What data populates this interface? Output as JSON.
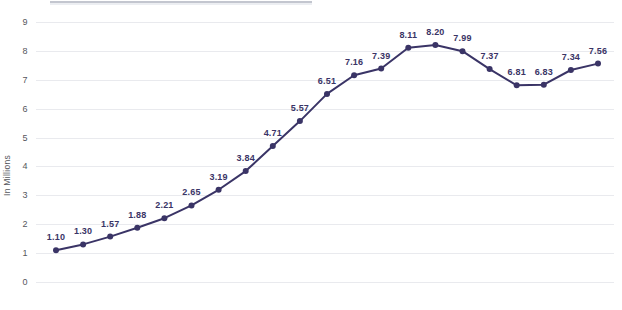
{
  "chart_data": {
    "type": "line",
    "title": "",
    "subtitle": "",
    "xlabel": "",
    "ylabel": "In Millions",
    "categories": [
      "1801",
      "1811",
      "1821",
      "1831",
      "1841",
      "1851",
      "1861",
      "1871",
      "1881",
      "1891",
      "1901",
      "1911",
      "1921",
      "1931",
      "1951",
      "1961",
      "1971",
      "1981",
      "1991",
      "2001",
      "2006"
    ],
    "x_tick_labels": [
      "1801",
      "1811",
      "1821",
      "1831",
      "1841",
      "1851",
      "1861",
      "1871",
      "1881",
      "1891",
      "1901",
      "1911",
      "1921",
      "1931",
      "1951",
      "1961",
      "1971",
      "1981",
      "1991",
      "2001",
      "2006"
    ],
    "values": [
      1.1,
      1.3,
      1.57,
      1.88,
      2.21,
      2.65,
      3.19,
      3.84,
      4.71,
      5.57,
      6.51,
      7.16,
      7.39,
      8.11,
      8.2,
      7.99,
      7.37,
      6.81,
      6.83,
      7.34,
      7.56
    ],
    "point_labels": [
      "1.10",
      "1.30",
      "1.57",
      "1.88",
      "2.21",
      "2.65",
      "3.19",
      "3.84",
      "4.71",
      "5.57",
      "6.51",
      "7.16",
      "7.39",
      "8.11",
      "8.20",
      "7.99",
      "7.37",
      "6.81",
      "6.83",
      "7.34",
      "7.56"
    ],
    "y_tick_labels": [
      "0",
      "1",
      "2",
      "3",
      "4",
      "5",
      "6",
      "7",
      "8",
      "9"
    ],
    "y_ticks": [
      0,
      1,
      2,
      3,
      4,
      5,
      6,
      7,
      8,
      9
    ],
    "ylim": [
      0,
      9
    ],
    "grid": true,
    "grid_axis": "y",
    "legend": false,
    "legend_position": "none",
    "series": [
      {
        "name": "Population",
        "values": [
          1.1,
          1.3,
          1.57,
          1.88,
          2.21,
          2.65,
          3.19,
          3.84,
          4.71,
          5.57,
          6.51,
          7.16,
          7.39,
          8.11,
          8.2,
          7.99,
          7.37,
          6.81,
          6.83,
          7.34,
          7.56
        ]
      }
    ],
    "colors": {
      "line": "#3a3466",
      "marker": "#3a3466",
      "label_text": "#3a3466",
      "grid": "#e9eaee",
      "tick_text": "#55565c",
      "background": "#ffffff"
    }
  }
}
